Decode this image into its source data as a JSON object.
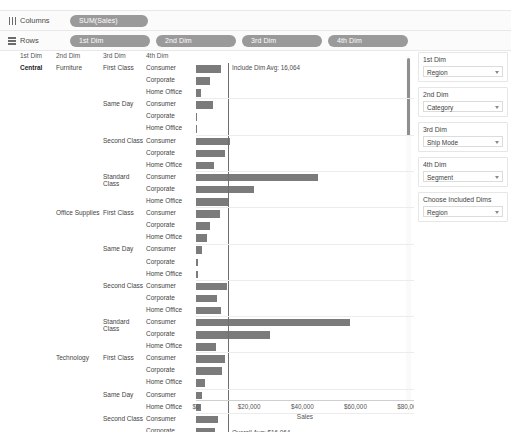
{
  "shelves": {
    "columns": {
      "label": "Columns",
      "icon": "columns-icon",
      "pills": [
        "SUM(Sales)"
      ]
    },
    "rows": {
      "label": "Rows",
      "icon": "rows-icon",
      "pills": [
        "1st Dim",
        "2nd Dim",
        "3rd Dim",
        "4th Dim"
      ]
    }
  },
  "table": {
    "headers": [
      "1st Dim",
      "2nd Dim",
      "3rd Dim",
      "4th Dim"
    ]
  },
  "annotations": {
    "include_dim_avg": "Include Dim Avg: 16,064",
    "overall_avg": "Overall Avg: $16,064"
  },
  "panel": {
    "groups": [
      {
        "title": "1st Dim",
        "value": "Region"
      },
      {
        "title": "2nd Dim",
        "value": "Category"
      },
      {
        "title": "3rd Dim",
        "value": "Ship Mode"
      },
      {
        "title": "4th Dim",
        "value": "Segment"
      },
      {
        "title": "Choose Included Dims",
        "value": "Region"
      }
    ]
  },
  "colors": {
    "bar": "#7b7b7b",
    "pill": "#9a9a9a",
    "reference_line": "#6e6e6e"
  },
  "chart_data": {
    "type": "bar",
    "title": "",
    "xlabel": "Sales",
    "ylabel": "",
    "xlim": [
      0,
      82000
    ],
    "ticks": [
      "$0",
      "$20,000",
      "$40,000",
      "$60,000",
      "$80,000"
    ],
    "tick_values": [
      0,
      20000,
      40000,
      60000,
      80000
    ],
    "grid": false,
    "legend": "none",
    "reference_lines": [
      {
        "label": "Include Dim Avg: 16,064",
        "value": 12000
      },
      {
        "label": "Overall Avg: $16,064",
        "value": 12000
      }
    ],
    "rows": [
      {
        "dim1": "Central",
        "dim2": "Furniture",
        "dim3": "First Class",
        "dim4": "Consumer",
        "value": 9400
      },
      {
        "dim1": "",
        "dim2": "",
        "dim3": "",
        "dim4": "Corporate",
        "value": 5300
      },
      {
        "dim1": "",
        "dim2": "",
        "dim3": "",
        "dim4": "Home Office",
        "value": 1900
      },
      {
        "dim1": "",
        "dim2": "",
        "dim3": "Same Day",
        "dim4": "Consumer",
        "value": 6400
      },
      {
        "dim1": "",
        "dim2": "",
        "dim3": "",
        "dim4": "Corporate",
        "value": 400
      },
      {
        "dim1": "",
        "dim2": "",
        "dim3": "",
        "dim4": "Home Office",
        "value": 450
      },
      {
        "dim1": "",
        "dim2": "",
        "dim3": "Second Class",
        "dim4": "Consumer",
        "value": 12800
      },
      {
        "dim1": "",
        "dim2": "",
        "dim3": "",
        "dim4": "Corporate",
        "value": 11000
      },
      {
        "dim1": "",
        "dim2": "",
        "dim3": "",
        "dim4": "Home Office",
        "value": 6800
      },
      {
        "dim1": "",
        "dim2": "",
        "dim3": "Standard Class",
        "dim4": "Consumer",
        "value": 46000
      },
      {
        "dim1": "",
        "dim2": "",
        "dim3": "",
        "dim4": "Corporate",
        "value": 22000
      },
      {
        "dim1": "",
        "dim2": "",
        "dim3": "",
        "dim4": "Home Office",
        "value": 12500
      },
      {
        "dim1": "",
        "dim2": "Office Supplies",
        "dim3": "First Class",
        "dim4": "Consumer",
        "value": 9000
      },
      {
        "dim1": "",
        "dim2": "",
        "dim3": "",
        "dim4": "Corporate",
        "value": 5200
      },
      {
        "dim1": "",
        "dim2": "",
        "dim3": "",
        "dim4": "Home Office",
        "value": 4200
      },
      {
        "dim1": "",
        "dim2": "",
        "dim3": "Same Day",
        "dim4": "Consumer",
        "value": 2400
      },
      {
        "dim1": "",
        "dim2": "",
        "dim3": "",
        "dim4": "Corporate",
        "value": 800
      },
      {
        "dim1": "",
        "dim2": "",
        "dim3": "",
        "dim4": "Home Office",
        "value": 700
      },
      {
        "dim1": "",
        "dim2": "",
        "dim3": "Second Class",
        "dim4": "Consumer",
        "value": 11500
      },
      {
        "dim1": "",
        "dim2": "",
        "dim3": "",
        "dim4": "Corporate",
        "value": 8000
      },
      {
        "dim1": "",
        "dim2": "",
        "dim3": "",
        "dim4": "Home Office",
        "value": 9500
      },
      {
        "dim1": "",
        "dim2": "",
        "dim3": "Standard Class",
        "dim4": "Consumer",
        "value": 58000
      },
      {
        "dim1": "",
        "dim2": "",
        "dim3": "",
        "dim4": "Corporate",
        "value": 28000
      },
      {
        "dim1": "",
        "dim2": "",
        "dim3": "",
        "dim4": "Home Office",
        "value": 7500
      },
      {
        "dim1": "",
        "dim2": "Technology",
        "dim3": "First Class",
        "dim4": "Consumer",
        "value": 11000
      },
      {
        "dim1": "",
        "dim2": "",
        "dim3": "",
        "dim4": "Corporate",
        "value": 9800
      },
      {
        "dim1": "",
        "dim2": "",
        "dim3": "",
        "dim4": "Home Office",
        "value": 3200
      },
      {
        "dim1": "",
        "dim2": "",
        "dim3": "Same Day",
        "dim4": "Consumer",
        "value": 2200
      },
      {
        "dim1": "",
        "dim2": "",
        "dim3": "",
        "dim4": "Home Office",
        "value": 1900
      },
      {
        "dim1": "",
        "dim2": "",
        "dim3": "Second Class",
        "dim4": "Consumer",
        "value": 8200
      },
      {
        "dim1": "",
        "dim2": "",
        "dim3": "",
        "dim4": "Corporate",
        "value": 7000
      }
    ]
  }
}
